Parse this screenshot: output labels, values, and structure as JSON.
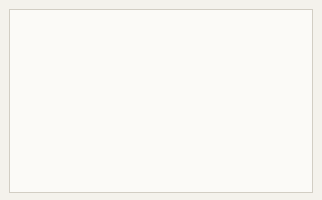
{
  "page": {
    "corner_mark": "1",
    "background_color": "#f4f2ec",
    "panel_color": "#fbfaf7",
    "border_color": "#d2cec4"
  },
  "chart_data": {
    "type": "line",
    "xlabel": "",
    "ylabel": "Time (in millions years BC)",
    "ylim": [
      60,
      0
    ],
    "y_ticks": [
      10,
      20,
      30,
      40,
      50,
      60
    ],
    "y_tick_labels": [
      "10",
      "20",
      "30",
      "40",
      "50",
      "60"
    ],
    "grid": true,
    "legend_position": "inline-labels",
    "axis_direction": "inverted",
    "origin_point_mya": 58,
    "line_color": "#b9b6b0",
    "series": [
      {
        "name": "Pavian",
        "label": "Pavian",
        "label_position": "top",
        "divergence_mya": 35,
        "points": [
          [
            0.5,
            58
          ],
          [
            0.49,
            50
          ],
          [
            0.47,
            42
          ],
          [
            0.455,
            35
          ],
          [
            0.44,
            26
          ],
          [
            0.435,
            17
          ],
          [
            0.435,
            8
          ],
          [
            0.435,
            0
          ]
        ]
      },
      {
        "name": "Gibbon",
        "label": "Gibbon",
        "label_position": "top",
        "divergence_mya": 30,
        "points": [
          [
            0.5,
            58
          ],
          [
            0.51,
            50
          ],
          [
            0.53,
            42
          ],
          [
            0.555,
            34
          ],
          [
            0.585,
            25
          ],
          [
            0.605,
            15
          ],
          [
            0.615,
            7
          ],
          [
            0.615,
            0
          ]
        ]
      },
      {
        "name": "Orang-utan",
        "label": "Orang-utan",
        "label_position": "top",
        "divergence_mya": 20,
        "points": [
          [
            0.5,
            58
          ],
          [
            0.515,
            50
          ],
          [
            0.545,
            41
          ],
          [
            0.59,
            32
          ],
          [
            0.655,
            23
          ],
          [
            0.715,
            14
          ],
          [
            0.745,
            6
          ],
          [
            0.755,
            0
          ]
        ]
      },
      {
        "name": "Gorilla",
        "label": "Gorilla",
        "label_position": "top",
        "divergence_mya": 12,
        "points": [
          [
            0.5,
            58
          ],
          [
            0.52,
            49
          ],
          [
            0.56,
            40
          ],
          [
            0.625,
            30
          ],
          [
            0.715,
            21
          ],
          [
            0.805,
            13
          ],
          [
            0.865,
            6
          ],
          [
            0.885,
            0
          ]
        ]
      },
      {
        "name": "Human",
        "label": "Human",
        "label_position": "top",
        "divergence_mya": 7,
        "points": [
          [
            0.5,
            58
          ],
          [
            0.522,
            49
          ],
          [
            0.565,
            39
          ],
          [
            0.64,
            29
          ],
          [
            0.735,
            20
          ],
          [
            0.84,
            12
          ],
          [
            0.925,
            5
          ],
          [
            0.955,
            0
          ]
        ]
      },
      {
        "name": "Chimpanzee",
        "label": "Chimpanzee",
        "label_position": "right",
        "divergence_mya": 7,
        "points": [
          [
            0.5,
            58
          ],
          [
            0.523,
            49
          ],
          [
            0.567,
            39
          ],
          [
            0.645,
            29
          ],
          [
            0.745,
            20
          ],
          [
            0.855,
            13
          ],
          [
            0.945,
            9
          ],
          [
            1.0,
            8
          ]
        ]
      },
      {
        "name": "Lemur-branch",
        "label": "",
        "label_position": "none",
        "divergence_mya": 55,
        "points": [
          [
            0.5,
            58
          ],
          [
            0.44,
            50
          ],
          [
            0.36,
            40
          ],
          [
            0.29,
            28
          ],
          [
            0.235,
            15
          ],
          [
            0.205,
            5
          ],
          [
            0.195,
            0
          ]
        ]
      }
    ],
    "group_labels": [
      {
        "text": "Lemur Ape",
        "x": 0.205,
        "y": 33,
        "rotation": -62
      },
      {
        "text": "New World Ape",
        "x": 0.285,
        "y": 40,
        "rotation": -62
      },
      {
        "text": "Old World Ape",
        "x": 0.375,
        "y": 44,
        "rotation": -56
      },
      {
        "text": "Hominoid",
        "x": 0.495,
        "y": 44,
        "rotation": -50
      }
    ],
    "top_labels": [
      {
        "text": "Pavian",
        "x": 0.455
      },
      {
        "text": "Gibbon",
        "x": 0.625
      },
      {
        "text": "Orang-utan",
        "x": 0.735
      },
      {
        "text": "Gorilla",
        "x": 0.875
      },
      {
        "text": "Human",
        "x": 0.955
      }
    ],
    "right_labels": [
      {
        "text": "Chimpanzee",
        "x": 1.0,
        "y": 8
      }
    ]
  }
}
